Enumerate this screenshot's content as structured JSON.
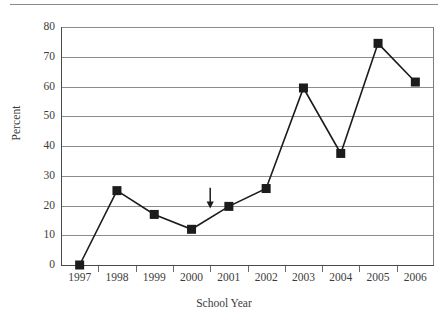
{
  "figure": {
    "has_top_rule": true,
    "background_color": "#ffffff",
    "ink_color": "#1c1c1c",
    "grid_color": "#8c8c8c"
  },
  "chart_data": {
    "type": "line",
    "title": "",
    "subtitle": "",
    "xlabel": "School Year",
    "ylabel": "Percent",
    "categories": [
      "1997",
      "1998",
      "1999",
      "2000",
      "2001",
      "2002",
      "2003",
      "2004",
      "2005",
      "2006"
    ],
    "values": [
      0,
      25,
      17,
      12,
      19.7,
      25.7,
      59.5,
      37.5,
      74.5,
      61.5
    ],
    "series": [
      {
        "name": "Percent",
        "marker": "filled-square",
        "line_style": "solid",
        "color": "#1c1c1c",
        "values": [
          0,
          25,
          17,
          12,
          19.7,
          25.7,
          59.5,
          37.5,
          74.5,
          61.5
        ]
      }
    ],
    "ylim": [
      0,
      80
    ],
    "ytick_values": [
      0,
      10,
      20,
      30,
      40,
      50,
      60,
      70,
      80
    ],
    "ytick_labels": [
      "0",
      "10",
      "20",
      "30",
      "40",
      "50",
      "60",
      "70",
      "80"
    ],
    "xtick_labels": [
      "1997",
      "1998",
      "1999",
      "2000",
      "2001",
      "2002",
      "2003",
      "2004",
      "2005",
      "2006"
    ],
    "grid": "horizontal",
    "legend": "none",
    "annotations": [
      {
        "kind": "down-arrow",
        "x_position_between": [
          "2000",
          "2001"
        ],
        "x_index": 3.5,
        "y_top": 26,
        "y_bottom": 19,
        "label": ""
      }
    ]
  }
}
